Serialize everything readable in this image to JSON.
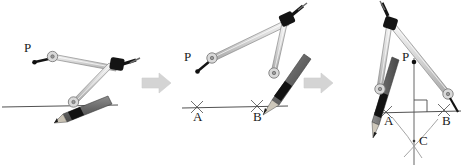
{
  "figure": {
    "panel_count": 3,
    "background_color": "#ffffff",
    "line_color": "#4a4a4a",
    "arm_light_color": "#d9d9d9",
    "arm_outline_color": "#808080",
    "joint_dark_color": "#111111",
    "pencil_color": "#6e6e6e",
    "arrow_color": "#d2d2d2"
  },
  "panels": [
    {
      "id": "panel-1",
      "name": "step-1",
      "labels": [
        {
          "id": "label-p",
          "text": "P",
          "x": 22,
          "y": 47
        }
      ],
      "baseline": {
        "present": true,
        "ticks": []
      },
      "points": [
        {
          "id": "point-p",
          "text": "",
          "x": 40,
          "y": 60
        }
      ]
    },
    {
      "id": "panel-2",
      "name": "step-2",
      "labels": [
        {
          "id": "label-p",
          "text": "P",
          "x": 216,
          "y": 49
        },
        {
          "id": "label-a",
          "text": "A",
          "x": 192,
          "y": 117
        },
        {
          "id": "label-b",
          "text": "B",
          "x": 254,
          "y": 117
        }
      ],
      "baseline": {
        "present": true,
        "ticks": [
          "A",
          "B"
        ]
      },
      "points": [
        {
          "id": "point-p",
          "text": "",
          "x": 232,
          "y": 66
        }
      ]
    },
    {
      "id": "panel-3",
      "name": "step-3",
      "labels": [
        {
          "id": "label-p",
          "text": "P",
          "x": 402,
          "y": 57
        },
        {
          "id": "label-a",
          "text": "A",
          "x": 385,
          "y": 120
        },
        {
          "id": "label-b",
          "text": "B",
          "x": 443,
          "y": 120
        },
        {
          "id": "label-c",
          "text": "C",
          "x": 424,
          "y": 140
        }
      ],
      "baseline": {
        "present": true,
        "ticks": [
          "A",
          "B"
        ]
      },
      "markers": {
        "right_angle": true,
        "intersection_arcs": 2,
        "vertical_line": true
      },
      "points": [
        {
          "id": "point-p",
          "text": "",
          "x": 414,
          "y": 62
        },
        {
          "id": "point-c",
          "text": "",
          "x": 414,
          "y": 141
        }
      ]
    }
  ],
  "arrows": [
    {
      "id": "arrow-1",
      "name": "step-arrow-1",
      "direction": "right"
    },
    {
      "id": "arrow-2",
      "name": "step-arrow-2",
      "direction": "right"
    }
  ]
}
